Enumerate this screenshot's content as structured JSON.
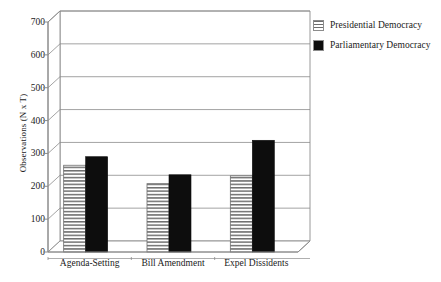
{
  "chart_data": {
    "type": "bar",
    "title": "",
    "subtitle": "",
    "xlabel": "",
    "ylabel": "Observations (N x T)",
    "categories": [
      "Agenda-Setting",
      "Bill Amendment",
      "Expel Dissidents"
    ],
    "series": [
      {
        "name": "Presidential Democracy",
        "pattern": "horizontal-stripes",
        "color": "#ffffff",
        "values": [
          264,
          208,
          232
        ]
      },
      {
        "name": "Parliamentary Democracy",
        "pattern": "solid",
        "color": "#0d0d0d",
        "values": [
          290,
          235,
          340
        ]
      }
    ],
    "ylim": [
      0,
      700
    ],
    "yticks": [
      0,
      100,
      200,
      300,
      400,
      500,
      600,
      700
    ],
    "ytick_labels": [
      "0",
      "100",
      "200",
      "300",
      "400",
      "500",
      "600",
      "700"
    ],
    "grid": true,
    "grid_axis": "y",
    "legend_position": "top-right",
    "style": "3d-perspective",
    "annotations": []
  },
  "legend": {
    "entries": [
      {
        "label": "Presidential Democracy",
        "swatch": "striped"
      },
      {
        "label": "Parliamentary Democracy",
        "swatch": "solid"
      }
    ]
  },
  "colors": {
    "frame": "#8c8c8c",
    "gridline": "#8c8c8c",
    "bar_solid": "#0d0d0d",
    "bar_stripe_dark": "#6e6e6e",
    "bar_stripe_light": "#ffffff",
    "bar_outline": "#6e6e6e",
    "text": "#1a1a1a",
    "background": "#ffffff"
  }
}
